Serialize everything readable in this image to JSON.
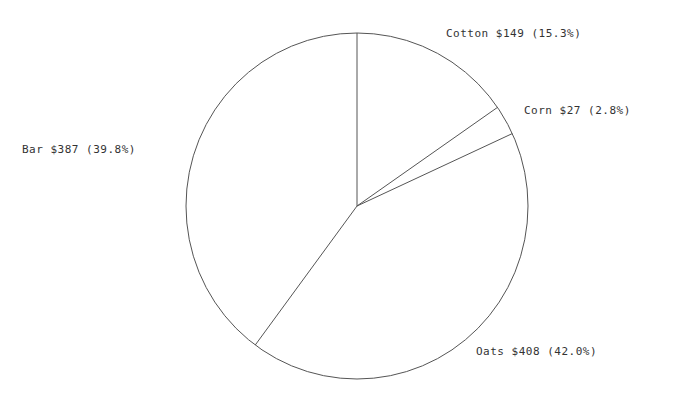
{
  "chart_data": {
    "type": "pie",
    "title": "",
    "slices": [
      {
        "name": "Cotton",
        "value": 149,
        "percent": 15.3,
        "label": "Cotton $149 (15.3%)"
      },
      {
        "name": "Corn",
        "value": 27,
        "percent": 2.8,
        "label": "Corn $27 (2.8%)"
      },
      {
        "name": "Oats",
        "value": 408,
        "percent": 42.0,
        "label": "Oats $408 (42.0%)"
      },
      {
        "name": "Bar",
        "value": 387,
        "percent": 39.8,
        "label": "Bar $387 (39.8%)"
      }
    ],
    "start_angle": "12 o'clock",
    "direction": "clockwise",
    "legend": "none",
    "colors": {
      "stroke": "#555555",
      "fill": "#ffffff",
      "text": "#333333"
    }
  }
}
